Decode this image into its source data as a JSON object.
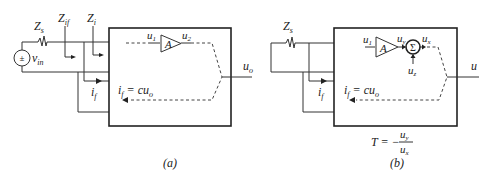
{
  "diagram": {
    "panel_a": {
      "caption": "(a)",
      "source_impedance": "Z",
      "source_impedance_sub": "s",
      "source_symbol": "±",
      "source_voltage": "v",
      "source_voltage_sub": "in",
      "input_impedance_fb": "Z",
      "input_impedance_fb_sub": "if",
      "input_impedance": "Z",
      "input_impedance_sub": "i",
      "feedback_current": "i",
      "feedback_current_sub": "f",
      "amp_label": "A",
      "amp_in": "u",
      "amp_in_sub": "1",
      "amp_out": "u",
      "amp_out_sub": "2",
      "feedback_eq_lhs": "i",
      "feedback_eq_lhs_sub": "f",
      "feedback_eq_rhs": " = cu",
      "feedback_eq_rhs_sub": "o",
      "output": "u",
      "output_sub": "o"
    },
    "panel_b": {
      "caption": "(b)",
      "source_impedance": "Z",
      "source_impedance_sub": "s",
      "feedback_current": "i",
      "feedback_current_sub": "f",
      "amp_label": "A",
      "amp_in": "u",
      "amp_in_sub": "1",
      "amp_out": "u",
      "amp_out_sub": "y",
      "sum_symbol": "Σ",
      "sum_out": "u",
      "sum_out_sub": "x",
      "sum_in": "u",
      "sum_in_sub": "z",
      "feedback_eq_lhs": "i",
      "feedback_eq_lhs_sub": "f",
      "feedback_eq_rhs": " = cu",
      "feedback_eq_rhs_sub": "o",
      "output": "u",
      "loop_gain_lhs": "T = −",
      "loop_gain_num": "u",
      "loop_gain_num_sub": "y",
      "loop_gain_den": "u",
      "loop_gain_den_sub": "x"
    }
  }
}
